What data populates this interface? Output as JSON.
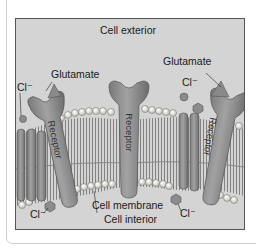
{
  "diagram": {
    "title_top": "Cell exterior",
    "title_bottom": "Cell interior",
    "labels": {
      "glutamate_left": "Glutamate",
      "glutamate_right": "Glutamate",
      "cl_top_left": "Cl⁻",
      "cl_top_right": "Cl⁻",
      "cl_bottom_left": "Cl⁻",
      "cl_bottom_right": "Cl⁻",
      "membrane": "Cell membrane",
      "receptor_left": "Receptor",
      "receptor_center": "Receptor",
      "receptor_right": "Receptor"
    },
    "colors": {
      "background": "#d4d4d4",
      "protein": "#8e8e8e",
      "protein_dark": "#6a6a6a",
      "lipid_head": "#f0f0e8",
      "tails": "#7a7a7a",
      "frame_border": "#555555"
    }
  }
}
